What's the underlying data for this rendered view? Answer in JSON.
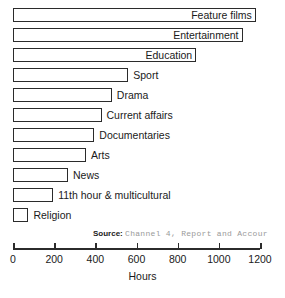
{
  "chart_data": {
    "type": "bar",
    "orientation": "horizontal",
    "title": "",
    "xlabel": "Hours",
    "ylabel": "",
    "xlim": [
      0,
      1200
    ],
    "xticks": [
      0,
      200,
      400,
      600,
      800,
      1000,
      1200
    ],
    "grid": false,
    "legend": null,
    "categories": [
      "Feature films",
      "Entertainment",
      "Education",
      "Sport",
      "Drama",
      "Current affairs",
      "Documentaries",
      "Arts",
      "News",
      "11th hour & multicultural",
      "Religion"
    ],
    "values": [
      1180,
      1115,
      890,
      560,
      480,
      430,
      395,
      355,
      267,
      195,
      75
    ],
    "label_placement": [
      "inside",
      "inside",
      "inside",
      "outside",
      "outside",
      "outside",
      "outside",
      "outside",
      "outside",
      "outside",
      "outside"
    ],
    "annotations": {
      "source_key": "Source:",
      "source_value": "Channel 4, Report and Accour"
    }
  },
  "style": {
    "bar_fill": "#ffffff",
    "bar_stroke": "#2b2b2b",
    "text_color": "#1a1a1a",
    "source_value_color": "#9a9a9a",
    "background": "#ffffff"
  }
}
